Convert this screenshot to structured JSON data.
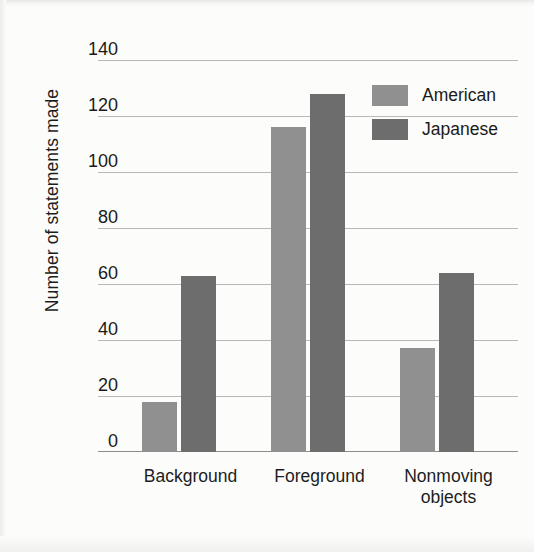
{
  "chart_data": {
    "type": "bar",
    "title": "",
    "xlabel": "",
    "ylabel": "Number of statements made",
    "categories": [
      "Background",
      "Foreground",
      "Nonmoving objects"
    ],
    "category_lines": [
      [
        "Background"
      ],
      [
        "Foreground"
      ],
      [
        "Nonmoving",
        "objects"
      ]
    ],
    "series": [
      {
        "name": "American",
        "color": "#909090",
        "values": [
          18,
          116,
          37
        ]
      },
      {
        "name": "Japanese",
        "color": "#6d6d6d",
        "values": [
          63,
          128,
          64
        ]
      }
    ],
    "ylim": [
      0,
      140
    ],
    "yticks": [
      0,
      20,
      40,
      60,
      80,
      100,
      120,
      140
    ],
    "ytick_labels": [
      "0",
      "20",
      "40",
      "60",
      "80",
      "100",
      "120",
      "140"
    ],
    "grid": true,
    "legend_position": "top-right"
  },
  "axis": {
    "y_title": "Number of statements made",
    "tick_140": "140",
    "tick_120": "120",
    "tick_100": "100",
    "tick_80": "80",
    "tick_60": "60",
    "tick_40": "40",
    "tick_20": "20",
    "tick_0": "0"
  },
  "xaxis": {
    "cat0": "Background",
    "cat1": "Foreground",
    "cat2_line1": "Nonmoving",
    "cat2_line2": "objects"
  },
  "legend": {
    "american": "American",
    "japanese": "Japanese"
  },
  "colors": {
    "american": "#909090",
    "japanese": "#6d6d6d",
    "gridline": "#b9b9b9",
    "axis": "#8c8c8c",
    "text": "#1a1a1a",
    "background": "#fcfcfb"
  }
}
